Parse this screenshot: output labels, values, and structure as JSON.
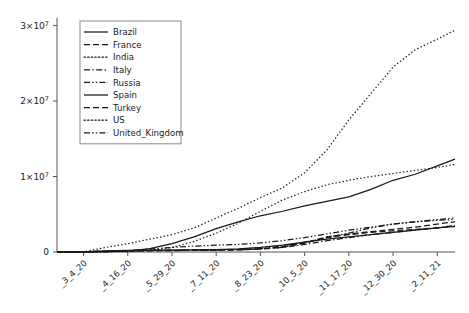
{
  "chart_data": {
    "type": "line",
    "title": "",
    "xlabel": "",
    "ylabel": "",
    "xlim": [
      0,
      9
    ],
    "ylim": [
      0,
      31000000
    ],
    "grid": false,
    "legend_position": "upper-left",
    "y_ticks": [
      {
        "value": 0,
        "label": "0",
        "mantissa": "",
        "exponent": ""
      },
      {
        "value": 10000000,
        "label": "1×10",
        "mantissa": "1×10",
        "exponent": "7"
      },
      {
        "value": 20000000,
        "label": "2×10",
        "mantissa": "2×10",
        "exponent": "7"
      },
      {
        "value": 30000000,
        "label": "3×10",
        "mantissa": "3×10",
        "exponent": "7"
      }
    ],
    "categories": [
      "_3_4_20",
      "_4_16_20",
      "_5_29_20",
      "_7_11_20",
      "_8_23_20",
      "_10_5_20",
      "_11_17_20",
      "_12_30_20",
      "_2_11_21"
    ],
    "x": [
      0.6,
      1.6,
      2.6,
      3.6,
      4.6,
      5.6,
      6.6,
      7.6,
      8.6
    ],
    "series": [
      {
        "name": "Brazil",
        "dash": "solid",
        "x": [
          0.0,
          0.6,
          1.1,
          1.6,
          2.1,
          2.6,
          3.1,
          3.6,
          4.1,
          4.6,
          5.1,
          5.6,
          6.1,
          6.6,
          7.1,
          7.6,
          8.1,
          8.6,
          9.0
        ],
        "values": [
          0,
          10000,
          40000,
          120000,
          440000,
          1100000,
          2000000,
          3100000,
          4000000,
          4800000,
          5400000,
          6100000,
          6700000,
          7300000,
          8300000,
          9500000,
          10300000,
          11400000,
          12300000
        ]
      },
      {
        "name": "France",
        "dash": "dashed",
        "x": [
          0.0,
          0.6,
          1.1,
          1.6,
          2.1,
          2.6,
          3.1,
          3.6,
          4.1,
          4.6,
          5.1,
          5.6,
          6.1,
          6.6,
          7.1,
          7.6,
          8.1,
          8.6,
          9.0
        ],
        "values": [
          0,
          20000,
          110000,
          160000,
          180000,
          190000,
          210000,
          230000,
          280000,
          400000,
          700000,
          1200000,
          2000000,
          2400000,
          2700000,
          3000000,
          3300000,
          3700000,
          4000000
        ]
      },
      {
        "name": "India",
        "dash": "dotted",
        "x": [
          0.0,
          0.6,
          1.1,
          1.6,
          2.1,
          2.6,
          3.1,
          3.6,
          4.1,
          4.6,
          5.1,
          5.6,
          6.1,
          6.6,
          7.1,
          7.6,
          8.1,
          8.6,
          9.0
        ],
        "values": [
          0,
          5000,
          20000,
          60000,
          200000,
          600000,
          1400000,
          2500000,
          3800000,
          5400000,
          6900000,
          8000000,
          8900000,
          9500000,
          10000000,
          10400000,
          10800000,
          11200000,
          11600000
        ]
      },
      {
        "name": "Italy",
        "dash": "dashdot",
        "x": [
          0.0,
          0.6,
          1.1,
          1.6,
          2.1,
          2.6,
          3.1,
          3.6,
          4.1,
          4.6,
          5.1,
          5.6,
          6.1,
          6.6,
          7.1,
          7.6,
          8.1,
          8.6,
          9.0
        ],
        "values": [
          0,
          30000,
          130000,
          190000,
          230000,
          240000,
          250000,
          260000,
          290000,
          400000,
          600000,
          1000000,
          1500000,
          1900000,
          2300000,
          2600000,
          2900000,
          3200000,
          3500000
        ]
      },
      {
        "name": "Russia",
        "dash": "dashdotdot",
        "x": [
          0.0,
          0.6,
          1.1,
          1.6,
          2.1,
          2.6,
          3.1,
          3.6,
          4.1,
          4.6,
          5.1,
          5.6,
          6.1,
          6.6,
          7.1,
          7.6,
          8.1,
          8.6,
          9.0
        ],
        "values": [
          0,
          3000,
          30000,
          150000,
          400000,
          600000,
          780000,
          900000,
          1000000,
          1200000,
          1500000,
          1900000,
          2400000,
          2900000,
          3300000,
          3700000,
          4000000,
          4300000,
          4500000
        ]
      },
      {
        "name": "Spain",
        "dash": "solid",
        "x": [
          0.0,
          0.6,
          1.1,
          1.6,
          2.1,
          2.6,
          3.1,
          3.6,
          4.1,
          4.6,
          5.1,
          5.6,
          6.1,
          6.6,
          7.1,
          7.6,
          8.1,
          8.6,
          9.0
        ],
        "values": [
          0,
          20000,
          140000,
          200000,
          240000,
          250000,
          280000,
          320000,
          400000,
          600000,
          900000,
          1300000,
          1700000,
          2000000,
          2300000,
          2600000,
          2900000,
          3200000,
          3400000
        ]
      },
      {
        "name": "Turkey",
        "dash": "dashed",
        "x": [
          0.0,
          0.6,
          1.1,
          1.6,
          2.1,
          2.6,
          3.1,
          3.6,
          4.1,
          4.6,
          5.1,
          5.6,
          6.1,
          6.6,
          7.1,
          7.6,
          8.1,
          8.6,
          9.0
        ],
        "values": [
          0,
          1000,
          60000,
          130000,
          170000,
          200000,
          240000,
          280000,
          330000,
          400000,
          600000,
          1200000,
          1900000,
          2300000,
          2600000,
          2800000,
          3000000,
          3200000,
          3400000
        ]
      },
      {
        "name": "US",
        "dash": "dotted",
        "x": [
          0.0,
          0.6,
          1.1,
          1.6,
          2.1,
          2.6,
          3.1,
          3.6,
          4.1,
          4.6,
          5.1,
          5.6,
          6.1,
          6.6,
          7.1,
          7.6,
          8.1,
          8.6,
          9.0
        ],
        "values": [
          0,
          30000,
          600000,
          1100000,
          1700000,
          2300000,
          3200000,
          4500000,
          5800000,
          7200000,
          8500000,
          10500000,
          13500000,
          17500000,
          21000000,
          24500000,
          26800000,
          28200000,
          29400000
        ]
      },
      {
        "name": "United_Kingdom",
        "dash": "dashdotdot",
        "x": [
          0.0,
          0.6,
          1.1,
          1.6,
          2.1,
          2.6,
          3.1,
          3.6,
          4.1,
          4.6,
          5.1,
          5.6,
          6.1,
          6.6,
          7.1,
          7.6,
          8.1,
          8.6,
          9.0
        ],
        "values": [
          0,
          5000,
          80000,
          140000,
          190000,
          230000,
          270000,
          300000,
          330000,
          450000,
          800000,
          1300000,
          1900000,
          2500000,
          3200000,
          3700000,
          4000000,
          4200000,
          4300000
        ]
      }
    ]
  },
  "colors": {
    "line": "#1a1a1a",
    "axis": "#555555",
    "legend_border": "#8a8a8a",
    "background": "#ffffff"
  }
}
